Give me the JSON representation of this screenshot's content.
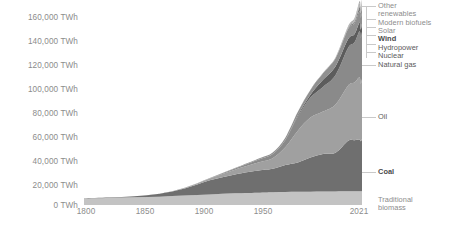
{
  "chart_data": {
    "type": "area",
    "title": "",
    "subtitle": "",
    "xlabel": "",
    "ylabel": "",
    "unit": "TWh",
    "grid": false,
    "stacked": true,
    "legend_position": "right",
    "xlim": [
      1800,
      2021
    ],
    "ylim": [
      0,
      170000
    ],
    "x_ticks": [
      {
        "label": "1800",
        "value": 1800
      },
      {
        "label": "1850",
        "value": 1850
      },
      {
        "label": "1900",
        "value": 1900
      },
      {
        "label": "1950",
        "value": 1950
      },
      {
        "label": "2021",
        "value": 2021
      }
    ],
    "y_ticks": [
      {
        "label": "0 TWh",
        "value": 0
      },
      {
        "label": "20,000 TWh",
        "value": 20000
      },
      {
        "label": "40,000 TWh",
        "value": 40000
      },
      {
        "label": "60,000 TWh",
        "value": 60000
      },
      {
        "label": "80,000 TWh",
        "value": 80000
      },
      {
        "label": "100,000 TWh",
        "value": 100000
      },
      {
        "label": "120,000 TWh",
        "value": 120000
      },
      {
        "label": "140,000 TWh",
        "value": 140000
      },
      {
        "label": "160,000 TWh",
        "value": 160000
      }
    ],
    "x": [
      1800,
      1820,
      1840,
      1860,
      1880,
      1900,
      1920,
      1940,
      1950,
      1960,
      1970,
      1980,
      1990,
      2000,
      2010,
      2015,
      2019,
      2020,
      2021
    ],
    "series": [
      {
        "name": "Traditional biomass",
        "color": "#c3c3c3",
        "values": [
          5600,
          6000,
          6500,
          7000,
          8000,
          9000,
          10000,
          10500,
          10800,
          11000,
          11200,
          11300,
          11400,
          11500,
          11600,
          11600,
          11600,
          11600,
          11600
        ]
      },
      {
        "name": "Coal",
        "color": "#6f6f6f",
        "values": [
          100,
          300,
          900,
          2500,
          6000,
          12000,
          16000,
          19000,
          20000,
          23000,
          25000,
          29000,
          32000,
          33000,
          43000,
          43500,
          44000,
          42500,
          44500
        ]
      },
      {
        "name": "Oil",
        "color": "#a0a0a0",
        "values": [
          0,
          0,
          0,
          100,
          500,
          1500,
          4000,
          7000,
          9000,
          15000,
          27000,
          34000,
          36000,
          41000,
          47000,
          49000,
          53000,
          49000,
          51000
        ]
      },
      {
        "name": "Natural gas",
        "color": "#8a8a8a",
        "values": [
          0,
          0,
          0,
          0,
          100,
          300,
          1000,
          2500,
          3500,
          6000,
          12000,
          17000,
          21000,
          25000,
          32000,
          34000,
          39000,
          39000,
          40000
        ]
      },
      {
        "name": "Nuclear",
        "color": "#5c5c5c",
        "values": [
          0,
          0,
          0,
          0,
          0,
          0,
          0,
          0,
          0,
          200,
          1000,
          2500,
          6000,
          7500,
          7400,
          7000,
          7300,
          7000,
          7100
        ]
      },
      {
        "name": "Hydropower",
        "color": "#909090",
        "values": [
          0,
          0,
          0,
          0,
          0,
          100,
          400,
          900,
          1300,
          2000,
          3000,
          4000,
          5500,
          6700,
          8500,
          9200,
          10000,
          10200,
          10300
        ]
      },
      {
        "name": "Wind",
        "color": "#7d7d7d",
        "values": [
          0,
          0,
          0,
          0,
          0,
          0,
          0,
          0,
          0,
          0,
          0,
          0,
          20,
          100,
          600,
          1400,
          3400,
          3900,
          4400
        ]
      },
      {
        "name": "Solar",
        "color": "#b0b0b0",
        "values": [
          0,
          0,
          0,
          0,
          0,
          0,
          0,
          0,
          0,
          0,
          0,
          0,
          0,
          10,
          150,
          600,
          1900,
          2300,
          2700
        ]
      },
      {
        "name": "Modern biofuels",
        "color": "#989898",
        "values": [
          0,
          0,
          0,
          0,
          0,
          0,
          0,
          0,
          0,
          0,
          0,
          50,
          150,
          300,
          800,
          1000,
          1100,
          1050,
          1100
        ]
      },
      {
        "name": "Other renewables",
        "color": "#aaaaaa",
        "values": [
          0,
          0,
          0,
          0,
          0,
          0,
          0,
          0,
          0,
          0,
          50,
          100,
          300,
          500,
          1000,
          1400,
          1900,
          2000,
          2100
        ]
      }
    ],
    "annotations": [
      {
        "label": "Other renewables",
        "series": "Other renewables"
      },
      {
        "label": "Modern biofuels",
        "series": "Modern biofuels"
      },
      {
        "label": "Solar",
        "series": "Solar"
      },
      {
        "label": "Wind",
        "series": "Wind"
      },
      {
        "label": "Hydropower",
        "series": "Hydropower"
      },
      {
        "label": "Nuclear",
        "series": "Nuclear"
      },
      {
        "label": "Natural gas",
        "series": "Natural gas"
      },
      {
        "label": "Oil",
        "series": "Oil"
      },
      {
        "label": "Coal",
        "series": "Coal"
      },
      {
        "label": "Traditional biomass",
        "series": "Traditional biomass"
      }
    ]
  },
  "legend": {
    "other_renewables_line1": "Other",
    "other_renewables_line2": "renewables",
    "modern_biofuels": "Modern biofuels",
    "solar": "Solar",
    "wind": "Wind",
    "hydropower": "Hydropower",
    "nuclear": "Nuclear",
    "natural_gas": "Natural gas",
    "oil": "Oil",
    "coal": "Coal",
    "traditional_biomass_line1": "Traditional",
    "traditional_biomass_line2": "biomass"
  },
  "axis": {
    "y0": "0 TWh",
    "y1": "20,000 TWh",
    "y2": "40,000 TWh",
    "y3": "60,000 TWh",
    "y4": "80,000 TWh",
    "y5": "100,000 TWh",
    "y6": "120,000 TWh",
    "y7": "140,000 TWh",
    "y8": "160,000 TWh",
    "x0": "1800",
    "x1": "1850",
    "x2": "1900",
    "x3": "1950",
    "x4": "2021"
  }
}
